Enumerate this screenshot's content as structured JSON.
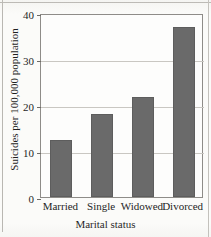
{
  "figure": {
    "background_color": "#fbfbf9",
    "bar_color": "#6a6a6a",
    "grid_color": "#c9c7c2",
    "frame_color": "#8e8c88"
  },
  "chart_data": {
    "type": "bar",
    "title": "",
    "categories": [
      "Married",
      "Single",
      "Widowed",
      "Divorced"
    ],
    "values": [
      12.3,
      18.0,
      21.8,
      37.0
    ],
    "xlabel": "Marital status",
    "ylabel": "Suicides per 100,000 population",
    "ylim": [
      0,
      40
    ],
    "yticks": [
      0,
      10,
      20,
      30,
      40
    ],
    "ytick_labels": [
      "0",
      "10",
      "20",
      "30",
      "40"
    ],
    "grid": true,
    "grid_axis": "y",
    "legend": false,
    "legend_position": "none",
    "series": [
      {
        "name": "Suicides per 100,000 population",
        "values": [
          12.3,
          18.0,
          21.8,
          37.0
        ]
      }
    ]
  }
}
